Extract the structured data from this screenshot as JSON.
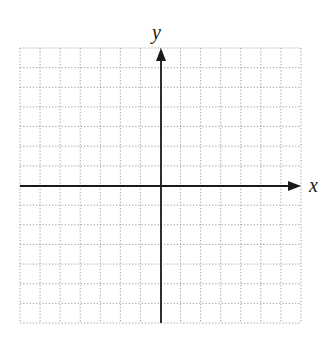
{
  "chart_data": {
    "type": "blank-coordinate-grid",
    "title": "",
    "xlabel": "x",
    "ylabel": "y",
    "xlim": [
      -7,
      7
    ],
    "ylim": [
      -7,
      7
    ],
    "grid": true,
    "grid_style": "dotted",
    "grid_step": 1,
    "tick_labels": [],
    "series": [],
    "legend": null
  },
  "layout": {
    "grid_left": 20,
    "grid_top": 48,
    "grid_right": 301,
    "grid_bottom": 323,
    "origin_x": 161,
    "origin_y": 186,
    "x_axis_start": 20,
    "x_axis_end": 301,
    "y_axis_start": 323,
    "y_axis_end": 48
  },
  "colors": {
    "grid": "#9a9a9a",
    "axis": "#1a1a1a",
    "background": "#ffffff"
  },
  "labels": {
    "x_axis": "x",
    "y_axis": "y"
  }
}
